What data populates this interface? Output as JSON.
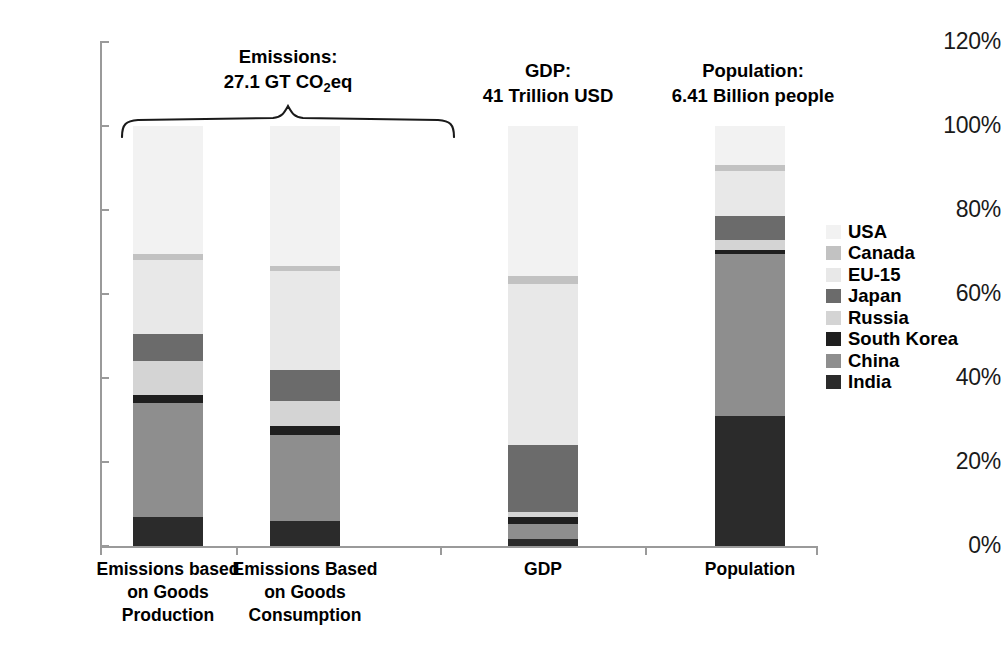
{
  "chart_data": {
    "type": "bar",
    "title": "",
    "subtitle": "",
    "xlabel": "",
    "ylabel": "",
    "ylim": [
      0,
      120
    ],
    "grid": false,
    "stacked": true,
    "stack_normalized": true,
    "legend_position": "right",
    "y_ticks": [
      "0%",
      "20%",
      "40%",
      "60%",
      "80%",
      "100%",
      "120%"
    ],
    "y_tick_values": [
      0,
      20,
      40,
      60,
      80,
      100,
      120
    ],
    "categories": [
      "Emissions based on Goods Production",
      "Emissions Based on Goods Consumption",
      "GDP",
      "Population"
    ],
    "category_labels": [
      [
        "Emissions based",
        "on Goods",
        "Production"
      ],
      [
        "Emissions Based",
        "on Goods",
        "Consumption"
      ],
      [
        "GDP"
      ],
      [
        "Population"
      ]
    ],
    "series": [
      {
        "name": "India",
        "color": "#2b2b2b",
        "values": [
          7.0,
          6.0,
          1.6,
          31.0
        ]
      },
      {
        "name": "China",
        "color": "#8e8e8e",
        "values": [
          27.0,
          20.5,
          3.6,
          38.5
        ]
      },
      {
        "name": "South Korea",
        "color": "#1f1f1f",
        "values": [
          2.0,
          2.0,
          1.8,
          0.9
        ]
      },
      {
        "name": "Russia",
        "color": "#d4d4d4",
        "values": [
          8.0,
          6.0,
          1.2,
          2.4
        ]
      },
      {
        "name": "Japan",
        "color": "#6b6b6b",
        "values": [
          6.5,
          7.5,
          15.8,
          5.7
        ]
      },
      {
        "name": "EU-15",
        "color": "#e8e8e8",
        "values": [
          17.5,
          23.5,
          38.4,
          10.8
        ]
      },
      {
        "name": "Canada",
        "color": "#c2c2c2",
        "values": [
          1.5,
          1.2,
          1.9,
          1.5
        ]
      },
      {
        "name": "USA",
        "color": "#f2f2f2",
        "values": [
          30.5,
          33.3,
          35.7,
          9.2
        ]
      }
    ],
    "annotations": [
      {
        "id": "emissions",
        "lines": [
          "Emissions:",
          "27.1 GT CO2eq"
        ],
        "spans_categories": [
          0,
          1
        ]
      },
      {
        "id": "gdp",
        "lines": [
          "GDP:",
          "41 Trillion USD"
        ],
        "spans_categories": [
          2
        ]
      },
      {
        "id": "population",
        "lines": [
          "Population:",
          "6.41 Billion people"
        ],
        "spans_categories": [
          3
        ]
      }
    ]
  },
  "annotations_text": {
    "emissions_line1": "Emissions:",
    "emissions_line2_pre": "27.1 GT CO",
    "emissions_line2_sub": "2",
    "emissions_line2_post": "eq",
    "gdp_line1": "GDP:",
    "gdp_line2": "41 Trillion USD",
    "population_line1": "Population:",
    "population_line2": "6.41 Billion people"
  },
  "legend": {
    "entries": [
      {
        "label": "USA",
        "color": "#f2f2f2"
      },
      {
        "label": "Canada",
        "color": "#c2c2c2"
      },
      {
        "label": "EU-15",
        "color": "#e8e8e8"
      },
      {
        "label": "Japan",
        "color": "#6b6b6b"
      },
      {
        "label": "Russia",
        "color": "#d4d4d4"
      },
      {
        "label": "South Korea",
        "color": "#1f1f1f"
      },
      {
        "label": "China",
        "color": "#8e8e8e"
      },
      {
        "label": "India",
        "color": "#2b2b2b"
      }
    ]
  },
  "axis": {
    "tick_labels": [
      "120%",
      "100%",
      "80%",
      "60%",
      "40%",
      "20%",
      "0%"
    ]
  },
  "colors": {
    "axis_line": "#9a9a9a",
    "text": "#000000",
    "background": "#ffffff"
  }
}
